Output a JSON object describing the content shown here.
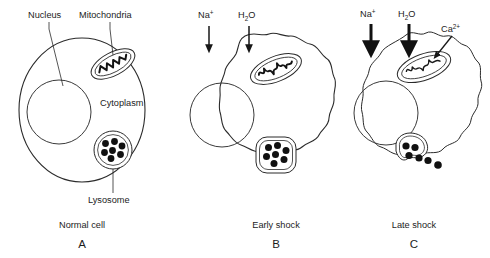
{
  "figure": {
    "background_color": "#ffffff",
    "ink_color": "#1c1c1c"
  },
  "labels": {
    "nucleus": "Nucleus",
    "mitochondria": "Mitochondria",
    "cytoplasm": "Cytoplasm",
    "lysosome": "Lysosome",
    "sodium_ion": "Na",
    "sodium_charge": "+",
    "water_h": "H",
    "water_sub": "2",
    "water_o": "O",
    "calcium_ion": "Ca",
    "calcium_charge": "2+"
  },
  "panels": [
    {
      "id": "A",
      "letter": "A",
      "caption": "Normal cell",
      "state": "normal",
      "membrane_shape": "smooth-ellipse",
      "nucleus_present": true,
      "mitochondria_state": "condensed-dark-cristae",
      "lysosome_state": "intact",
      "lysosome_granule_count": 7,
      "influx_arrows": [],
      "callouts": [
        "Nucleus",
        "Mitochondria",
        "Cytoplasm",
        "Lysosome"
      ]
    },
    {
      "id": "B",
      "letter": "B",
      "caption": "Early shock",
      "state": "early-shock",
      "membrane_shape": "scalloped-swollen",
      "nucleus_present": true,
      "mitochondria_state": "swollen-wavy-cristae",
      "lysosome_state": "intact-rounded-square",
      "lysosome_granule_count": 7,
      "influx_arrows": [
        "Na+",
        "H2O"
      ],
      "arrow_weight": "thin",
      "callouts": []
    },
    {
      "id": "C",
      "letter": "C",
      "caption": "Late shock",
      "state": "late-shock",
      "membrane_shape": "irregular-blebbed",
      "nucleus_present": true,
      "mitochondria_state": "markedly-swollen-pale",
      "lysosome_state": "ruptured-leaking",
      "lysosome_granule_count": 6,
      "influx_arrows": [
        "Na+",
        "H2O",
        "Ca2+"
      ],
      "arrow_weight": "thick",
      "callouts": [
        "Ca2+"
      ]
    }
  ]
}
